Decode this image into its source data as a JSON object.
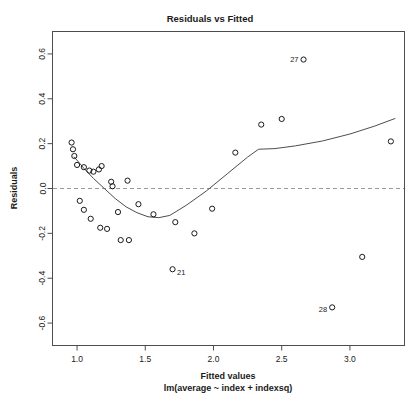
{
  "chart_data": {
    "type": "scatter",
    "title": "Residuals vs Fitted",
    "xlabel": "Fitted values",
    "sublabel": "lm(average ~ index + indexsq)",
    "ylabel": "Residuals",
    "xlim": [
      0.82,
      3.4
    ],
    "ylim": [
      -0.7,
      0.7
    ],
    "xticks": [
      1.0,
      1.5,
      2.0,
      2.5,
      3.0
    ],
    "xtick_labels": [
      "1.0",
      "1.5",
      "2.0",
      "2.5",
      "3.0"
    ],
    "yticks": [
      -0.6,
      -0.4,
      -0.2,
      0.0,
      0.2,
      0.4,
      0.6
    ],
    "ytick_labels": [
      "-0.6",
      "-0.4",
      "-0.2",
      "0.0",
      "0.2",
      "0.4",
      "0.6"
    ],
    "grid": false,
    "legend": "none",
    "zero_reference_line": 0.0,
    "marker": "open-circle",
    "points": [
      {
        "x": 0.96,
        "y": 0.205
      },
      {
        "x": 0.97,
        "y": 0.175
      },
      {
        "x": 0.98,
        "y": 0.145
      },
      {
        "x": 1.0,
        "y": 0.105
      },
      {
        "x": 1.05,
        "y": 0.095
      },
      {
        "x": 1.09,
        "y": 0.08
      },
      {
        "x": 1.12,
        "y": 0.075
      },
      {
        "x": 1.16,
        "y": 0.085
      },
      {
        "x": 1.18,
        "y": 0.1
      },
      {
        "x": 1.02,
        "y": -0.055
      },
      {
        "x": 1.05,
        "y": -0.095
      },
      {
        "x": 1.1,
        "y": -0.135
      },
      {
        "x": 1.25,
        "y": 0.03
      },
      {
        "x": 1.26,
        "y": 0.01
      },
      {
        "x": 1.3,
        "y": -0.105
      },
      {
        "x": 1.17,
        "y": -0.175
      },
      {
        "x": 1.22,
        "y": -0.18
      },
      {
        "x": 1.32,
        "y": -0.23
      },
      {
        "x": 1.38,
        "y": -0.23
      },
      {
        "x": 1.37,
        "y": 0.035
      },
      {
        "x": 1.45,
        "y": -0.07
      },
      {
        "x": 1.56,
        "y": -0.115
      },
      {
        "x": 1.7,
        "y": -0.36,
        "label": "21"
      },
      {
        "x": 1.72,
        "y": -0.15
      },
      {
        "x": 1.86,
        "y": -0.2
      },
      {
        "x": 1.99,
        "y": -0.09
      },
      {
        "x": 2.16,
        "y": 0.16
      },
      {
        "x": 2.35,
        "y": 0.285
      },
      {
        "x": 2.5,
        "y": 0.31
      },
      {
        "x": 2.66,
        "y": 0.575,
        "label": "27"
      },
      {
        "x": 2.87,
        "y": -0.53,
        "label": "28"
      },
      {
        "x": 3.09,
        "y": -0.305
      },
      {
        "x": 3.3,
        "y": 0.21
      }
    ],
    "smoother": [
      {
        "x": 0.98,
        "y": 0.14
      },
      {
        "x": 1.05,
        "y": 0.09
      },
      {
        "x": 1.12,
        "y": 0.045
      },
      {
        "x": 1.2,
        "y": 0.0
      },
      {
        "x": 1.28,
        "y": -0.045
      },
      {
        "x": 1.36,
        "y": -0.082
      },
      {
        "x": 1.44,
        "y": -0.108
      },
      {
        "x": 1.52,
        "y": -0.126
      },
      {
        "x": 1.6,
        "y": -0.13
      },
      {
        "x": 1.68,
        "y": -0.12
      },
      {
        "x": 1.8,
        "y": -0.075
      },
      {
        "x": 1.95,
        "y": -0.01
      },
      {
        "x": 2.1,
        "y": 0.065
      },
      {
        "x": 2.25,
        "y": 0.14
      },
      {
        "x": 2.33,
        "y": 0.175
      },
      {
        "x": 2.45,
        "y": 0.178
      },
      {
        "x": 2.6,
        "y": 0.19
      },
      {
        "x": 2.8,
        "y": 0.212
      },
      {
        "x": 3.0,
        "y": 0.243
      },
      {
        "x": 3.18,
        "y": 0.278
      },
      {
        "x": 3.33,
        "y": 0.312
      }
    ]
  }
}
